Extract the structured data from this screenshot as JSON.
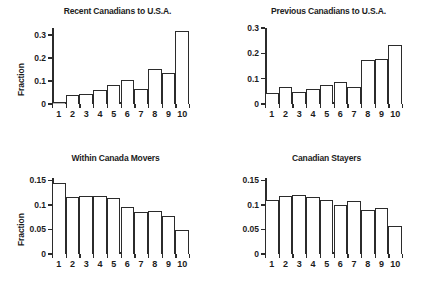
{
  "figure": {
    "ylabel": "Fraction",
    "categories": [
      "1",
      "2",
      "3",
      "4",
      "5",
      "6",
      "7",
      "8",
      "9",
      "10"
    ]
  },
  "chart_data": [
    {
      "type": "bar",
      "title": "Recent Canadians to U.S.A.",
      "xlabel": "",
      "ylabel": "Fraction",
      "categories": [
        "1",
        "2",
        "3",
        "4",
        "5",
        "6",
        "7",
        "8",
        "9",
        "10"
      ],
      "values": [
        0.008,
        0.038,
        0.045,
        0.06,
        0.082,
        0.106,
        0.065,
        0.15,
        0.135,
        0.315
      ],
      "ylim": [
        0,
        0.33
      ],
      "yticks": [
        0,
        0.1,
        0.2,
        0.3
      ],
      "ytick_labels": [
        "0",
        "0.1",
        "0.2",
        "0.3"
      ],
      "grid": false,
      "legend": false
    },
    {
      "type": "bar",
      "title": "Previous Canadians to U.S.A.",
      "xlabel": "",
      "ylabel": "",
      "categories": [
        "1",
        "2",
        "3",
        "4",
        "5",
        "6",
        "7",
        "8",
        "9",
        "10"
      ],
      "values": [
        0.043,
        0.068,
        0.046,
        0.059,
        0.074,
        0.088,
        0.068,
        0.173,
        0.179,
        0.233
      ],
      "ylim": [
        0,
        0.3
      ],
      "yticks": [
        0,
        0.1,
        0.2,
        0.3
      ],
      "ytick_labels": [
        "0",
        "0.1",
        "0.2",
        "0.3"
      ],
      "grid": false,
      "legend": false
    },
    {
      "type": "bar",
      "title": "Within Canada Movers",
      "xlabel": "",
      "ylabel": "Fraction",
      "categories": [
        "1",
        "2",
        "3",
        "4",
        "5",
        "6",
        "7",
        "8",
        "9",
        "10"
      ],
      "values": [
        0.144,
        0.116,
        0.119,
        0.119,
        0.115,
        0.096,
        0.085,
        0.088,
        0.078,
        0.049
      ],
      "ylim": [
        0,
        0.155
      ],
      "yticks": [
        0,
        0.05,
        0.1,
        0.15
      ],
      "ytick_labels": [
        "0",
        "0.05",
        "0.1",
        "0.15"
      ],
      "grid": false,
      "legend": false
    },
    {
      "type": "bar",
      "title": "Canadian Stayers",
      "xlabel": "",
      "ylabel": "",
      "categories": [
        "1",
        "2",
        "3",
        "4",
        "5",
        "6",
        "7",
        "8",
        "9",
        "10"
      ],
      "values": [
        0.111,
        0.119,
        0.12,
        0.117,
        0.11,
        0.1,
        0.108,
        0.09,
        0.094,
        0.057
      ],
      "ylim": [
        0,
        0.155
      ],
      "yticks": [
        0,
        0.05,
        0.1,
        0.15
      ],
      "ytick_labels": [
        "0",
        "0.05",
        "0.1",
        "0.15"
      ],
      "grid": false,
      "legend": false
    }
  ]
}
